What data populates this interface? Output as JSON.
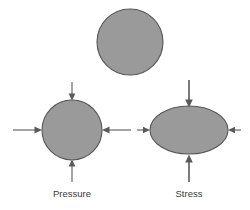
{
  "figure": {
    "background_color": "#ffffff",
    "shape_fill_color": "#9a9a9a",
    "shape_stroke_color": "#555555",
    "arrow_color": "#5a5a5a",
    "label_color": "#3a3a3a"
  },
  "shapes": {
    "undeformed": {
      "name": "undeformed-circle",
      "type": "circle",
      "cx": 130,
      "cy": 42,
      "r": 33,
      "label": ""
    },
    "pressure": {
      "name": "pressure-circle",
      "type": "circle",
      "cx": 72,
      "cy": 130,
      "r": 30,
      "label": "Pressure",
      "label_x": 72,
      "label_y": 197
    },
    "stress": {
      "name": "stress-ellipse",
      "type": "ellipse",
      "cx": 189,
      "cy": 130,
      "rx": 39,
      "ry": 24,
      "label": "Stress",
      "label_x": 189,
      "label_y": 197
    }
  },
  "arrows": {
    "pressure": [
      {
        "name": "pressure-arrow-top",
        "direction": "down",
        "x1": 72,
        "y1": 82,
        "x2": 72,
        "y2": 99
      },
      {
        "name": "pressure-arrow-left",
        "direction": "right",
        "x1": 13,
        "y1": 130,
        "x2": 41,
        "y2": 130
      },
      {
        "name": "pressure-arrow-right",
        "direction": "left",
        "x1": 131,
        "y1": 130,
        "x2": 103,
        "y2": 130
      },
      {
        "name": "pressure-arrow-bottom",
        "direction": "up",
        "x1": 72,
        "y1": 182,
        "x2": 72,
        "y2": 161
      }
    ],
    "stress": [
      {
        "name": "stress-arrow-top",
        "direction": "down",
        "x1": 189,
        "y1": 80,
        "x2": 189,
        "y2": 106
      },
      {
        "name": "stress-arrow-left",
        "direction": "right",
        "x1": 137,
        "y1": 130,
        "x2": 149,
        "y2": 130
      },
      {
        "name": "stress-arrow-right",
        "direction": "left",
        "x1": 241,
        "y1": 130,
        "x2": 229,
        "y2": 130
      },
      {
        "name": "stress-arrow-bottom",
        "direction": "up",
        "x1": 189,
        "y1": 182,
        "x2": 189,
        "y2": 156
      }
    ]
  },
  "captions": [
    {
      "name": "caption-pressure",
      "text": "Pressure",
      "x": 72,
      "y": 197
    },
    {
      "name": "caption-stress",
      "text": "Stress",
      "x": 189,
      "y": 197
    }
  ]
}
